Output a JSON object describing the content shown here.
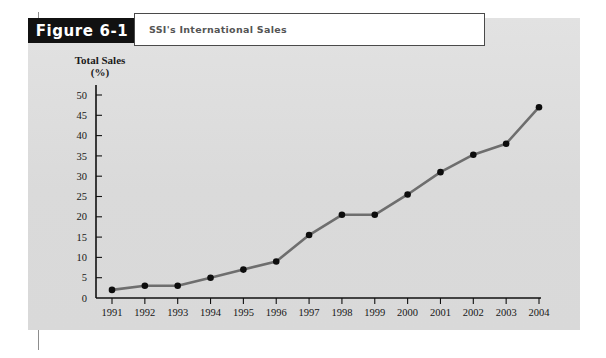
{
  "figure": {
    "tab_label": "Figure 6-1",
    "caption": "SSI's International Sales"
  },
  "colors": {
    "panel_background": "#dedede",
    "tab_background": "#111111",
    "tab_text": "#ffffff",
    "caption_background": "#ffffff",
    "caption_text": "#555555",
    "line": "#6e6e6e",
    "marker": "#0d0d0d",
    "axis": "#111111"
  },
  "chart_data": {
    "type": "line",
    "title": "SSI's International Sales",
    "xlabel": "",
    "ylabel": "Total Sales (%)",
    "ylabel_line1": "Total Sales",
    "ylabel_line2": "(%)",
    "categories": [
      "1991",
      "1992",
      "1993",
      "1994",
      "1995",
      "1996",
      "1997",
      "1998",
      "1999",
      "2000",
      "2001",
      "2002",
      "2003",
      "2004"
    ],
    "values": [
      2,
      3,
      3,
      5,
      7,
      9,
      15.5,
      20.5,
      20.5,
      25.5,
      31,
      35.3,
      38,
      47
    ],
    "ylim": [
      0,
      50
    ],
    "yticks": [
      0,
      5,
      10,
      15,
      20,
      25,
      30,
      35,
      40,
      45,
      50
    ],
    "ytick_labels": [
      "0",
      "5",
      "10",
      "15",
      "20",
      "25",
      "30",
      "35",
      "40",
      "45",
      "50"
    ],
    "grid": false,
    "legend": false
  }
}
